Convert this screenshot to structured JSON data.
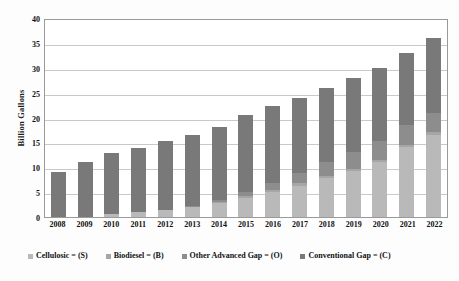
{
  "chart_data": {
    "type": "bar",
    "subtype": "stacked-bar",
    "title": "",
    "xlabel": "",
    "ylabel": "Billion Gallons",
    "ylim": [
      0,
      40
    ],
    "ytick_step": 5,
    "yticks": [
      "40",
      "35",
      "30",
      "25",
      "20",
      "15",
      "10",
      "5",
      "0"
    ],
    "ytick_values": [
      40,
      35,
      30,
      25,
      20,
      15,
      10,
      5,
      0
    ],
    "grid": true,
    "grid_axis": "y",
    "legend_position": "bottom",
    "categories": [
      "2008",
      "2009",
      "2010",
      "2011",
      "2012",
      "2013",
      "2014",
      "2015",
      "2016",
      "2017",
      "2018",
      "2019",
      "2020",
      "2021",
      "2022"
    ],
    "series": [
      {
        "name": "Cellulosic = (S)",
        "key": "S",
        "color": "#b9b9b9",
        "values": [
          0,
          0,
          0.65,
          1.0,
          1.5,
          2.0,
          2.75,
          3.75,
          5.0,
          6.25,
          7.75,
          9.25,
          11.0,
          14.0,
          16.5
        ]
      },
      {
        "name": "Biodiesel = (B)",
        "key": "B",
        "color": "#a6a6a6",
        "values": [
          0,
          0,
          0,
          0,
          0,
          0,
          0.25,
          0.5,
          0.5,
          0.5,
          0.5,
          0.5,
          0.5,
          0.5,
          0.5
        ]
      },
      {
        "name": "Other Advanced Gap = (O)",
        "key": "O",
        "color": "#8d8d8d",
        "values": [
          0,
          0,
          0,
          0,
          0,
          0.25,
          0.5,
          0.75,
          1.25,
          2.0,
          2.75,
          3.25,
          3.75,
          4.0,
          4.0
        ]
      },
      {
        "name": "Conventional Gap = (C)",
        "key": "C",
        "color": "#797979",
        "values": [
          9.0,
          11.1,
          12.3,
          12.95,
          13.7,
          14.3,
          14.65,
          15.5,
          15.5,
          15.25,
          15.0,
          15.0,
          14.75,
          14.5,
          15.0
        ]
      }
    ],
    "totals": [
      9.0,
      11.1,
      12.95,
      13.95,
      15.2,
      16.55,
      18.15,
      20.5,
      22.25,
      24.0,
      26.0,
      28.0,
      30.0,
      33.0,
      36.0
    ]
  },
  "legend": {
    "items": [
      {
        "label": "Cellulosic = (S)",
        "swatch": "#b9b9b9"
      },
      {
        "label": "Biodiesel = (B)",
        "swatch": "#a6a6a6"
      },
      {
        "label": "Other Advanced Gap = (O)",
        "swatch": "#8d8d8d"
      },
      {
        "label": "Conventional Gap = (C)",
        "swatch": "#797979"
      }
    ]
  },
  "axes": {
    "y_title": "Billion Gallons"
  }
}
